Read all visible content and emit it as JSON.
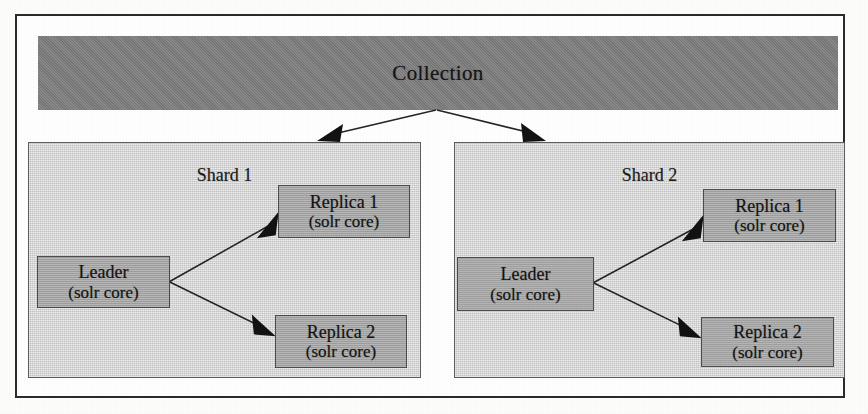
{
  "diagram": {
    "collection": {
      "label": "Collection"
    },
    "shards": [
      {
        "id": "shard-1",
        "title": "Shard 1",
        "leader": {
          "name": "Leader",
          "detail": "(solr core)"
        },
        "replicas": [
          {
            "name": "Replica 1",
            "detail": "(solr core)"
          },
          {
            "name": "Replica 2",
            "detail": "(solr core)"
          }
        ]
      },
      {
        "id": "shard-2",
        "title": "Shard 2",
        "leader": {
          "name": "Leader",
          "detail": "(solr core)"
        },
        "replicas": [
          {
            "name": "Replica 1",
            "detail": "(solr core)"
          },
          {
            "name": "Replica 2",
            "detail": "(solr core)"
          }
        ]
      }
    ],
    "colors": {
      "collection_fill": "#7e7d7d",
      "shard_fill": "#d2d2d2",
      "node_fill": "#a7a7a7",
      "border": "#2b2b2b",
      "arrow": "#121212",
      "page_background": "#ffffff"
    },
    "edges": [
      {
        "from": "collection",
        "to": "shard-1"
      },
      {
        "from": "collection",
        "to": "shard-2"
      },
      {
        "from": "shard-1.leader",
        "to": "shard-1.replica-1"
      },
      {
        "from": "shard-1.leader",
        "to": "shard-1.replica-2"
      },
      {
        "from": "shard-2.leader",
        "to": "shard-2.replica-1"
      },
      {
        "from": "shard-2.leader",
        "to": "shard-2.replica-2"
      }
    ]
  }
}
